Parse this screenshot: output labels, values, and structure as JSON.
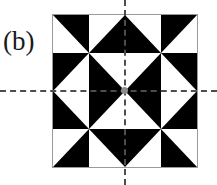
{
  "figure": {
    "panel_label": "(b)",
    "caption_text": "(b)",
    "colors": {
      "foreground": "#000000",
      "background": "#ffffff",
      "border": "#9a9a9a",
      "axis": "#4d4d4d",
      "center_dot": "#8c8c8c"
    },
    "square": {
      "rows": 4,
      "columns": 4,
      "width_px": 146,
      "height_px": 154,
      "left_px": 52,
      "top_px": 14
    },
    "axes": {
      "vertical_x_px": 125,
      "horizontal_y_px": 91,
      "style": "dashed",
      "description": "two dashed mirror axes crossing at the pattern center"
    },
    "tiles": [
      {
        "row": 1,
        "col": 1,
        "name": "tile-r1c1",
        "black_half": "upper-right",
        "points": "0,0 100,0 100,100"
      },
      {
        "row": 1,
        "col": 2,
        "name": "tile-r1c2",
        "black_half": "lower-right",
        "points": "100,0 100,100 0,100"
      },
      {
        "row": 1,
        "col": 3,
        "name": "tile-r1c3",
        "black_half": "lower-left",
        "points": "0,0 100,100 0,100"
      },
      {
        "row": 1,
        "col": 4,
        "name": "tile-r1c4",
        "black_half": "upper-left",
        "points": "0,0 100,0 0,100"
      },
      {
        "row": 2,
        "col": 1,
        "name": "tile-r2c1",
        "black_half": "upper-left",
        "points": "0,0 100,0 0,100"
      },
      {
        "row": 2,
        "col": 2,
        "name": "tile-r2c2",
        "black_half": "lower-left",
        "points": "0,0 100,100 0,100"
      },
      {
        "row": 2,
        "col": 3,
        "name": "tile-r2c3",
        "black_half": "lower-right",
        "points": "100,0 100,100 0,100"
      },
      {
        "row": 2,
        "col": 4,
        "name": "tile-r2c4",
        "black_half": "upper-right",
        "points": "0,0 100,0 100,100"
      },
      {
        "row": 3,
        "col": 1,
        "name": "tile-r3c1",
        "black_half": "lower-left",
        "points": "0,0 100,100 0,100"
      },
      {
        "row": 3,
        "col": 2,
        "name": "tile-r3c2",
        "black_half": "upper-left",
        "points": "0,0 100,0 0,100"
      },
      {
        "row": 3,
        "col": 3,
        "name": "tile-r3c3",
        "black_half": "upper-right",
        "points": "0,0 100,0 100,100"
      },
      {
        "row": 3,
        "col": 4,
        "name": "tile-r3c4",
        "black_half": "lower-right",
        "points": "100,0 100,100 0,100"
      },
      {
        "row": 4,
        "col": 1,
        "name": "tile-r4c1",
        "black_half": "lower-right",
        "points": "100,0 100,100 0,100"
      },
      {
        "row": 4,
        "col": 2,
        "name": "tile-r4c2",
        "black_half": "upper-right",
        "points": "0,0 100,0 100,100"
      },
      {
        "row": 4,
        "col": 3,
        "name": "tile-r4c3",
        "black_half": "upper-left",
        "points": "0,0 100,0 0,100"
      },
      {
        "row": 4,
        "col": 4,
        "name": "tile-r4c4",
        "black_half": "lower-left",
        "points": "0,0 100,100 0,100"
      }
    ]
  }
}
